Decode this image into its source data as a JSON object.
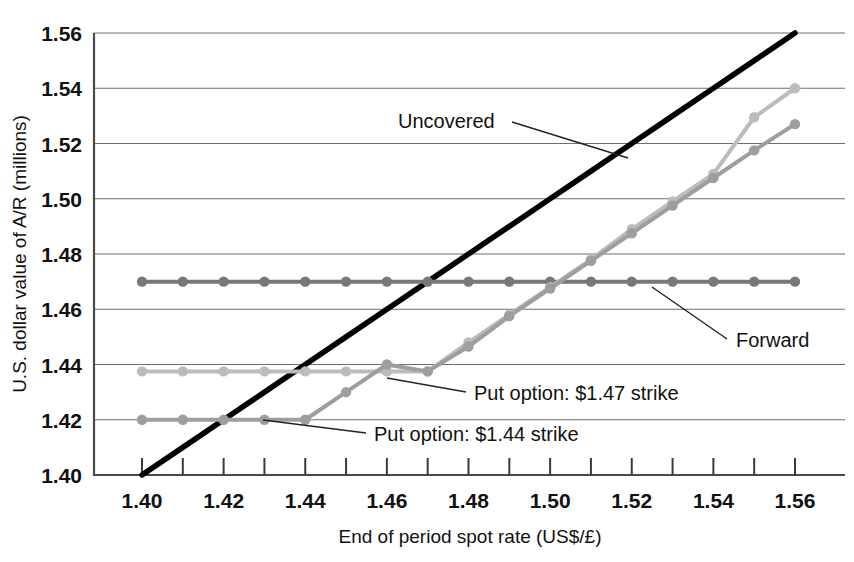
{
  "chart_data": {
    "type": "line",
    "title": "",
    "xlabel": "End of period spot rate (US$/£)",
    "ylabel": "U.S. dollar value of A/R (millions)",
    "xlim": [
      1.39,
      1.565
    ],
    "ylim": [
      1.4,
      1.56
    ],
    "xticks": [
      "1.40",
      "1.42",
      "1.44",
      "1.46",
      "1.48",
      "1.50",
      "1.52",
      "1.54",
      "1.56"
    ],
    "xtick_values": [
      1.4,
      1.42,
      1.44,
      1.46,
      1.48,
      1.5,
      1.52,
      1.54,
      1.56
    ],
    "xtick_minor_values": [
      1.41,
      1.43,
      1.45,
      1.47,
      1.49,
      1.51,
      1.53,
      1.55
    ],
    "yticks": [
      "1.40",
      "1.42",
      "1.44",
      "1.46",
      "1.48",
      "1.50",
      "1.52",
      "1.54",
      "1.56"
    ],
    "ytick_values": [
      1.4,
      1.42,
      1.44,
      1.46,
      1.48,
      1.5,
      1.52,
      1.54,
      1.56
    ],
    "grid": true,
    "legend_position": "inline-annotations",
    "x": [
      1.4,
      1.41,
      1.42,
      1.43,
      1.44,
      1.45,
      1.46,
      1.47,
      1.48,
      1.49,
      1.5,
      1.51,
      1.52,
      1.53,
      1.54,
      1.55,
      1.56
    ],
    "series": [
      {
        "name": "Uncovered",
        "color": "#000000",
        "width": 5.5,
        "markers": false,
        "values": [
          1.4,
          1.41,
          1.42,
          1.43,
          1.44,
          1.45,
          1.46,
          1.47,
          1.48,
          1.49,
          1.5,
          1.51,
          1.52,
          1.53,
          1.54,
          1.55,
          1.56
        ]
      },
      {
        "name": "Forward",
        "color": "#787878",
        "width": 4,
        "markers": true,
        "values": [
          1.47,
          1.47,
          1.47,
          1.47,
          1.47,
          1.47,
          1.47,
          1.47,
          1.47,
          1.47,
          1.47,
          1.47,
          1.47,
          1.47,
          1.47,
          1.47,
          1.47
        ]
      },
      {
        "name": "Put option: $1.47 strike",
        "color": "#bcbcbc",
        "width": 4,
        "markers": true,
        "values": [
          1.4375,
          1.4375,
          1.4375,
          1.4375,
          1.4375,
          1.4375,
          1.4375,
          1.4375,
          1.448,
          1.458,
          1.468,
          1.478,
          1.489,
          1.499,
          1.509,
          1.5295,
          1.54
        ]
      },
      {
        "name": "Put option: $1.44 strike",
        "color": "#9e9e9e",
        "width": 4,
        "markers": true,
        "values": [
          1.42,
          1.42,
          1.42,
          1.42,
          1.42,
          1.43,
          1.44,
          1.4375,
          1.4465,
          1.4575,
          1.4675,
          1.4775,
          1.4875,
          1.4975,
          1.5075,
          1.5175,
          1.527
        ]
      }
    ],
    "annotations": [
      {
        "name": "uncovered",
        "text": "Uncovered",
        "text_x": 398,
        "text_y": 128,
        "leader": [
          [
            512,
            122
          ],
          [
            628,
            158
          ]
        ]
      },
      {
        "name": "forward",
        "text": "Forward",
        "text_x": 736,
        "text_y": 347,
        "leader": [
          [
            727,
            339
          ],
          [
            652,
            287
          ]
        ]
      },
      {
        "name": "put-147",
        "text": "Put option: $1.47 strike",
        "text_x": 474,
        "text_y": 400,
        "leader": [
          [
            466,
            392
          ],
          [
            387,
            378
          ]
        ]
      },
      {
        "name": "put-144",
        "text": "Put option: $1.44 strike",
        "text_x": 374,
        "text_y": 441,
        "leader": [
          [
            366,
            433
          ],
          [
            263,
            420
          ]
        ]
      }
    ]
  },
  "plot_geometry": {
    "left": 94,
    "right": 845,
    "top": 33,
    "bottom": 475
  }
}
